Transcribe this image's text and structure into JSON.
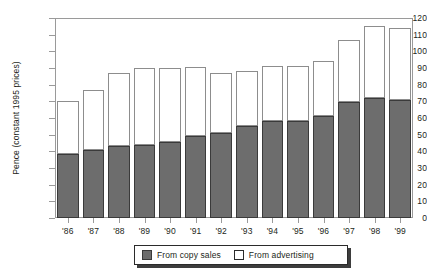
{
  "chart_data": {
    "type": "bar",
    "subtype": "stacked-vertical",
    "title": "",
    "subtitle": "",
    "xlabel": "",
    "ylabel": "Pence (constant 1995 prices)",
    "ylim": [
      0,
      120
    ],
    "ytick_step": 10,
    "yticks": [
      120,
      110,
      100,
      90,
      80,
      70,
      60,
      50,
      40,
      30,
      20,
      10,
      0
    ],
    "ytick_labels": [
      "120",
      "110",
      "100",
      "90",
      "80",
      "70",
      "60",
      "50",
      "40",
      "30",
      "20",
      "10",
      "0"
    ],
    "grid": false,
    "legend_position": "bottom-center",
    "categories": [
      "'86",
      "'87",
      "'88",
      "'89",
      "'90",
      "'91",
      "'92",
      "'93",
      "'94",
      "'95",
      "'96",
      "'97",
      "'98",
      "'99"
    ],
    "series": [
      {
        "name": "From copy sales",
        "color": "#6d6d6d",
        "values": [
          38.5,
          41.0,
          43.0,
          44.0,
          45.5,
          49.0,
          51.0,
          55.0,
          58.0,
          58.5,
          61.0,
          69.5,
          72.0,
          71.0
        ]
      },
      {
        "name": "From advertising",
        "color": "#ffffff",
        "values": [
          31.5,
          36.0,
          44.0,
          46.0,
          44.5,
          41.5,
          36.0,
          33.0,
          33.5,
          33.0,
          33.0,
          37.5,
          43.0,
          43.0
        ]
      }
    ],
    "totals": [
      70.0,
      77.0,
      87.0,
      90.0,
      90.0,
      90.5,
      87.0,
      88.0,
      91.5,
      91.5,
      94.0,
      107.0,
      115.0,
      114.0
    ],
    "annotations": []
  },
  "legend": {
    "items": [
      {
        "label": "From copy sales",
        "swatch": "filled-grey-swatch"
      },
      {
        "label": "From advertising",
        "swatch": "outlined-white-swatch"
      }
    ]
  },
  "colors": {
    "copy_sales": "#6d6d6d",
    "advertising": "#ffffff",
    "axis": "#9a9a9a",
    "bar_outline_dark": "#3a3a3a",
    "bar_outline_light": "#8d8d8d",
    "text": "#231f20",
    "legend_border": "#2b2b2b",
    "legend_shadow": "#3d3d3d",
    "background": "#ffffff"
  }
}
